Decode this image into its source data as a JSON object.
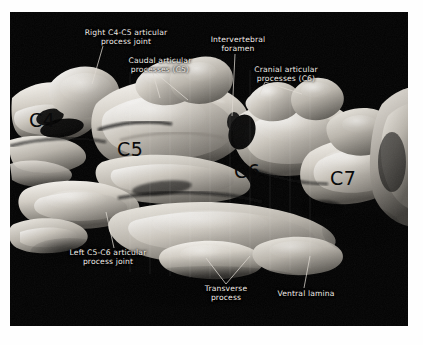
{
  "figure": {
    "type": "3d-ct-reconstruction",
    "background_color": "#030303",
    "page_color": "#fefefe",
    "label_color": "#f0ece6",
    "vertebra_tag_color": "#0a0a0a",
    "bone_color_light": "#f2efe9",
    "bone_color_mid": "#b9b4ab",
    "bone_color_dark": "#6d6962"
  },
  "annotations": [
    {
      "id": "right-c4-c5-joint",
      "text": "Right C4-C5 articular\nprocess joint"
    },
    {
      "id": "caudal-articular-processes-c5",
      "text": "Caudal articular\nprocesses (C5)"
    },
    {
      "id": "intervertebral-foramen",
      "text": "Intervertebral\nforamen"
    },
    {
      "id": "cranial-articular-processes-c6",
      "text": "Cranial articular\nprocesses (C6)"
    },
    {
      "id": "left-c5-c6-joint",
      "text": "Left C5-C6 articular\nprocess joint"
    },
    {
      "id": "transverse-process",
      "text": "Transverse\nprocess"
    },
    {
      "id": "ventral-lamina",
      "text": "Ventral lamina"
    }
  ],
  "vertebra_tags": [
    {
      "id": "c4",
      "text": "C4"
    },
    {
      "id": "c5",
      "text": "C5"
    },
    {
      "id": "c6",
      "text": "C6"
    },
    {
      "id": "c7",
      "text": "C7"
    }
  ]
}
